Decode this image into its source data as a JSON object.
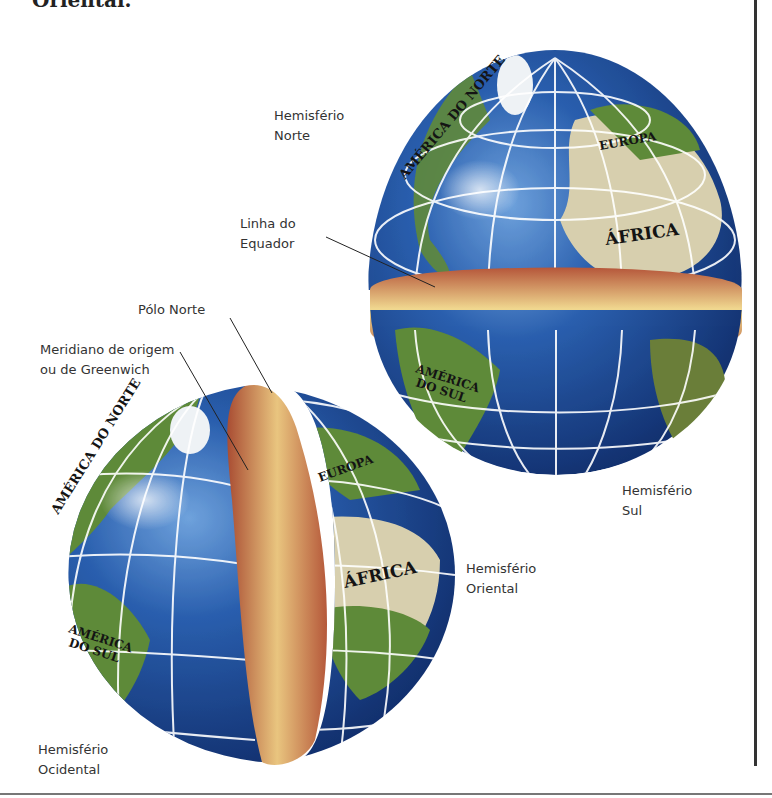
{
  "header": {
    "partial_title": "Oriental."
  },
  "labels": {
    "hemisferio_norte": "Hemisfério\nNorte",
    "linha_do_equador": "Linha do\nEquador",
    "polo_norte": "Pólo Norte",
    "meridiano": "Meridiano de origem\nou de Greenwich",
    "hemisferio_sul": "Hemisfério\nSul",
    "hemisferio_oriental": "Hemisfério\nOriental",
    "hemisferio_ocidental": "Hemisfério\nOcidental"
  },
  "continents": {
    "upper_globe": {
      "north_america": "AMÉRICA DO NORTE",
      "europe": "EUROPA",
      "africa": "ÁFRICA",
      "south_america_line1": "AMÉRICA",
      "south_america_line2": "DO SUL"
    },
    "lower_globe": {
      "north_america": "AMÉRICA DO NORTE",
      "europe": "EUROPA",
      "africa": "ÁFRICA",
      "south_america_line1": "AMÉRICA",
      "south_america_line2": "DO SUL"
    }
  },
  "colors": {
    "ocean": "#1e4a94",
    "ocean_dark": "#0f2a66",
    "land_green": "#5f8a3a",
    "land_desert": "#d8cfae",
    "cut_face_light": "#f0d890",
    "cut_face_dark": "#b3583a",
    "grid": "#ffffff"
  }
}
